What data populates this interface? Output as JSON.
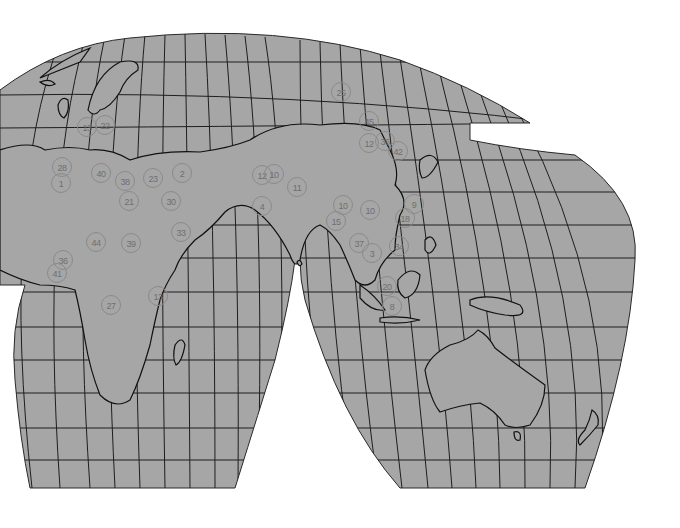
{
  "map": {
    "projection": "interrupted (Eastern Hemisphere lobes)",
    "land_color": "#a6a6a6",
    "ocean_color": "#a6a6a6",
    "background_color": "#ffffff",
    "line_color": "#1a1a1a",
    "marker_color": "#8a8a8a",
    "regions_visible": [
      "Europe",
      "Africa",
      "Middle East",
      "Asia",
      "Australia",
      "Oceania"
    ],
    "markers": [
      {
        "label": "1",
        "x": 61,
        "y": 183
      },
      {
        "label": "28",
        "x": 62,
        "y": 167
      },
      {
        "label": "13",
        "x": 87,
        "y": 127
      },
      {
        "label": "22",
        "x": 105,
        "y": 125
      },
      {
        "label": "40",
        "x": 101,
        "y": 173
      },
      {
        "label": "38",
        "x": 125,
        "y": 181
      },
      {
        "label": "23",
        "x": 153,
        "y": 178
      },
      {
        "label": "2",
        "x": 182,
        "y": 173
      },
      {
        "label": "21",
        "x": 129,
        "y": 201
      },
      {
        "label": "30",
        "x": 171,
        "y": 201
      },
      {
        "label": "33",
        "x": 181,
        "y": 232
      },
      {
        "label": "12",
        "x": 262,
        "y": 175
      },
      {
        "label": "10",
        "x": 274,
        "y": 174
      },
      {
        "label": "11",
        "x": 297,
        "y": 187
      },
      {
        "label": "4",
        "x": 262,
        "y": 206
      },
      {
        "label": "25",
        "x": 341,
        "y": 92
      },
      {
        "label": "45",
        "x": 369,
        "y": 121
      },
      {
        "label": "12",
        "x": 369,
        "y": 143
      },
      {
        "label": "36",
        "x": 385,
        "y": 141
      },
      {
        "label": "42",
        "x": 398,
        "y": 151
      },
      {
        "label": "10",
        "x": 343,
        "y": 205
      },
      {
        "label": "15",
        "x": 336,
        "y": 221
      },
      {
        "label": "10",
        "x": 370,
        "y": 210
      },
      {
        "label": "9",
        "x": 414,
        "y": 204
      },
      {
        "label": "18",
        "x": 405,
        "y": 218
      },
      {
        "label": "37",
        "x": 359,
        "y": 243
      },
      {
        "label": "3",
        "x": 372,
        "y": 253
      },
      {
        "label": "34",
        "x": 399,
        "y": 246
      },
      {
        "label": "20",
        "x": 387,
        "y": 286
      },
      {
        "label": "8",
        "x": 392,
        "y": 306
      },
      {
        "label": "44",
        "x": 96,
        "y": 242
      },
      {
        "label": "39",
        "x": 131,
        "y": 243
      },
      {
        "label": "36",
        "x": 63,
        "y": 260
      },
      {
        "label": "41",
        "x": 57,
        "y": 273
      },
      {
        "label": "13",
        "x": 158,
        "y": 296
      },
      {
        "label": "27",
        "x": 111,
        "y": 305
      }
    ]
  }
}
